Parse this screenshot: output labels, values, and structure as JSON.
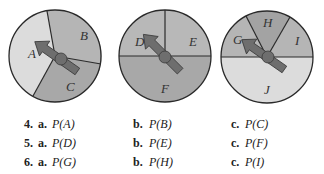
{
  "spinners": [
    {
      "sections": [
        "A",
        "B",
        "C"
      ]
    },
    {
      "sections": [
        "D",
        "E",
        "F"
      ]
    },
    {
      "sections": [
        "G",
        "H",
        "I",
        "J"
      ]
    }
  ],
  "colors": {
    "light": "#dcdcdc",
    "medium": "#b5b5b5",
    "dark": "#a3a3a3",
    "arrow": "#6e6e6e",
    "outline": "#2a2a2a"
  },
  "exercises": [
    {
      "number": "4.",
      "a_label": "a.",
      "a": "P(A)",
      "b_label": "b.",
      "b": "P(B)",
      "c_label": "c.",
      "c": "P(C)"
    },
    {
      "number": "5.",
      "a_label": "a.",
      "a": "P(D)",
      "b_label": "b.",
      "b": "P(E)",
      "c_label": "c.",
      "c": "P(F)"
    },
    {
      "number": "6.",
      "a_label": "a.",
      "a": "P(G)",
      "b_label": "b.",
      "b": "P(H)",
      "c_label": "c.",
      "c": "P(I)"
    }
  ]
}
